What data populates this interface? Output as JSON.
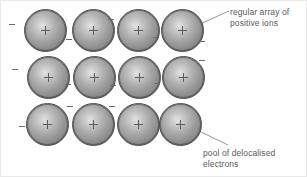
{
  "figure": {
    "background_color": "#ffffff"
  },
  "diagram": {
    "type": "metallic-lattice",
    "ion_label_glyph": "+",
    "electron_label_glyph": "-",
    "ion_color_center": "#e2e2e2",
    "ion_color_edge": "#767676",
    "ion_outline_color": "#4a4a4a",
    "line_color": "#8a8a8a",
    "text_color": "#5a5a5a",
    "rows": 3,
    "columns": 4,
    "ion_count": 12,
    "ions": [
      {
        "id": "ion-r1-c1",
        "x": 23,
        "y": 8
      },
      {
        "id": "ion-r1-c2",
        "x": 71,
        "y": 8
      },
      {
        "id": "ion-r1-c3",
        "x": 116,
        "y": 8
      },
      {
        "id": "ion-r1-c4",
        "x": 160,
        "y": 8
      },
      {
        "id": "ion-r2-c1",
        "x": 26,
        "y": 55
      },
      {
        "id": "ion-r2-c2",
        "x": 72,
        "y": 55
      },
      {
        "id": "ion-r2-c3",
        "x": 117,
        "y": 55
      },
      {
        "id": "ion-r2-c4",
        "x": 161,
        "y": 55
      },
      {
        "id": "ion-r3-c1",
        "x": 25,
        "y": 102
      },
      {
        "id": "ion-r3-c2",
        "x": 71,
        "y": 102
      },
      {
        "id": "ion-r3-c3",
        "x": 116,
        "y": 102
      },
      {
        "id": "ion-r3-c4",
        "x": 158,
        "y": 102
      }
    ],
    "electrons": [
      {
        "id": "electron-1",
        "x": 8,
        "y": 23
      },
      {
        "id": "electron-2",
        "x": 65,
        "y": 38
      },
      {
        "id": "electron-3",
        "x": 107,
        "y": 18
      },
      {
        "id": "electron-4",
        "x": 152,
        "y": 36
      },
      {
        "id": "electron-5",
        "x": 198,
        "y": 40
      },
      {
        "id": "electron-6",
        "x": 11,
        "y": 68
      },
      {
        "id": "electron-7",
        "x": 64,
        "y": 83
      },
      {
        "id": "electron-8",
        "x": 109,
        "y": 84
      },
      {
        "id": "electron-9",
        "x": 153,
        "y": 82
      },
      {
        "id": "electron-10",
        "x": 198,
        "y": 59
      },
      {
        "id": "electron-11",
        "x": 18,
        "y": 125
      },
      {
        "id": "electron-12",
        "x": 66,
        "y": 105
      },
      {
        "id": "electron-13",
        "x": 108,
        "y": 105
      }
    ],
    "leaders": [
      {
        "id": "leader-top",
        "from_x": 199,
        "from_y": 23,
        "to_x": 228,
        "to_y": 10
      },
      {
        "id": "leader-bottom",
        "from_x": 196,
        "from_y": 129,
        "to_x": 227,
        "to_y": 144
      }
    ]
  },
  "labels": {
    "top": "regular array of\npositive ions",
    "bottom": "pool of delocalised\nelectrons"
  }
}
